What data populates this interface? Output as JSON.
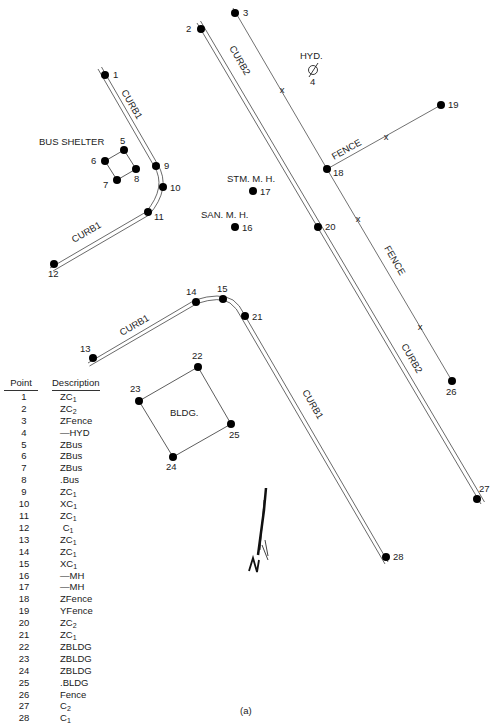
{
  "figure": {
    "caption": "(a)",
    "labels": {
      "bus_shelter": "BUS SHELTER",
      "hydrant": "HYD.",
      "storm_manhole": "STM. M. H.",
      "sanitary_manhole": "SAN. M. H.",
      "building": "BLDG.",
      "fence_top": "FENCE",
      "fence_right": "FENCE",
      "curb1_top": "CURB1",
      "curb1_left": "CURB1",
      "curb1_lower": "CURB1",
      "curb1_diag": "CURB1",
      "curb2_top": "CURB2",
      "curb2_lower": "CURB2",
      "north": "N"
    },
    "points": [
      {
        "id": "1",
        "x": 105,
        "y": 75
      },
      {
        "id": "2",
        "x": 201,
        "y": 29
      },
      {
        "id": "3",
        "x": 235,
        "y": 13
      },
      {
        "id": "4",
        "x": 313,
        "y": 70
      },
      {
        "id": "5",
        "x": 124,
        "y": 150
      },
      {
        "id": "6",
        "x": 105,
        "y": 161
      },
      {
        "id": "7",
        "x": 117,
        "y": 180
      },
      {
        "id": "8",
        "x": 136,
        "y": 169
      },
      {
        "id": "9",
        "x": 156,
        "y": 166
      },
      {
        "id": "10",
        "x": 163,
        "y": 187
      },
      {
        "id": "11",
        "x": 148,
        "y": 212
      },
      {
        "id": "12",
        "x": 54,
        "y": 264
      },
      {
        "id": "13",
        "x": 93,
        "y": 358
      },
      {
        "id": "14",
        "x": 196,
        "y": 302
      },
      {
        "id": "15",
        "x": 223,
        "y": 299
      },
      {
        "id": "16",
        "x": 235,
        "y": 227
      },
      {
        "id": "17",
        "x": 253,
        "y": 191
      },
      {
        "id": "18",
        "x": 327,
        "y": 169
      },
      {
        "id": "19",
        "x": 441,
        "y": 105
      },
      {
        "id": "20",
        "x": 318,
        "y": 227
      },
      {
        "id": "21",
        "x": 245,
        "y": 316
      },
      {
        "id": "22",
        "x": 198,
        "y": 367
      },
      {
        "id": "23",
        "x": 139,
        "y": 401
      },
      {
        "id": "24",
        "x": 173,
        "y": 457
      },
      {
        "id": "25",
        "x": 231,
        "y": 424
      },
      {
        "id": "26",
        "x": 452,
        "y": 381
      },
      {
        "id": "27",
        "x": 477,
        "y": 499
      },
      {
        "id": "28",
        "x": 386,
        "y": 557
      }
    ]
  },
  "table": {
    "headers": {
      "point": "Point",
      "description": "Description"
    },
    "rows": [
      {
        "point": "1",
        "code": "ZC",
        "sub": "1"
      },
      {
        "point": "2",
        "code": "ZC",
        "sub": "2"
      },
      {
        "point": "3",
        "code": "ZFence",
        "sub": ""
      },
      {
        "point": "4",
        "code": "—HYD",
        "sub": ""
      },
      {
        "point": "5",
        "code": "ZBus",
        "sub": ""
      },
      {
        "point": "6",
        "code": "ZBus",
        "sub": ""
      },
      {
        "point": "7",
        "code": "ZBus",
        "sub": ""
      },
      {
        "point": "8",
        "code": ".Bus",
        "sub": ""
      },
      {
        "point": "9",
        "code": "ZC",
        "sub": "1"
      },
      {
        "point": "10",
        "code": "XC",
        "sub": "1"
      },
      {
        "point": "11",
        "code": "ZC",
        "sub": "1"
      },
      {
        "point": "12",
        "code": " C",
        "sub": "1"
      },
      {
        "point": "13",
        "code": "ZC",
        "sub": "1"
      },
      {
        "point": "14",
        "code": "ZC",
        "sub": "1"
      },
      {
        "point": "15",
        "code": "XC",
        "sub": "1"
      },
      {
        "point": "16",
        "code": "—MH",
        "sub": ""
      },
      {
        "point": "17",
        "code": "—MH",
        "sub": ""
      },
      {
        "point": "18",
        "code": "ZFence",
        "sub": ""
      },
      {
        "point": "19",
        "code": "YFence",
        "sub": ""
      },
      {
        "point": "20",
        "code": "ZC",
        "sub": "2"
      },
      {
        "point": "21",
        "code": "ZC",
        "sub": "1"
      },
      {
        "point": "22",
        "code": "ZBLDG",
        "sub": ""
      },
      {
        "point": "23",
        "code": "ZBLDG",
        "sub": ""
      },
      {
        "point": "24",
        "code": "ZBLDG",
        "sub": ""
      },
      {
        "point": "25",
        "code": ".BLDG",
        "sub": ""
      },
      {
        "point": "26",
        "code": "Fence",
        "sub": ""
      },
      {
        "point": "27",
        "code": "C",
        "sub": "2"
      },
      {
        "point": "28",
        "code": "C",
        "sub": "1"
      }
    ]
  }
}
